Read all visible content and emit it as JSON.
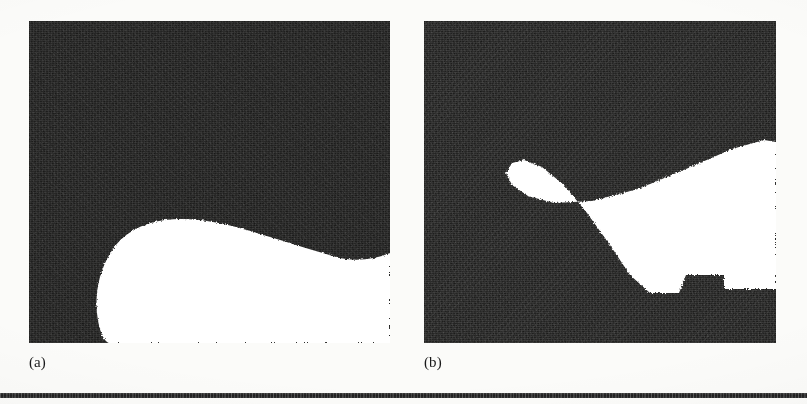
{
  "figure": {
    "kind": "scanned-figure",
    "page_background": "#fbfbf9",
    "panel_fill": "#131312",
    "region_fill": "#ffffff",
    "rule_color": "#2a2a2a",
    "panels": [
      {
        "id": "a",
        "caption": "(a)",
        "x": 29,
        "y": 21,
        "width": 361,
        "height": 322,
        "description": "binary segmentation result, dark background with a single white crescent-shaped region in the lower half that touches the bottom and right borders",
        "region_path": "M 361 206 L 361 232 C 344 239 325 241 307 236 C 272 226 243 216 214 208 C 186 200 160 196 136 199 C 112 202 93 213 82 231 C 70 250 66 272 68 292 C 70 311 76 325 84 322 L 300 322 L 300 322 L 361 322 Z"
      },
      {
        "id": "b",
        "caption": "(b)",
        "x": 424,
        "y": 21,
        "width": 352,
        "height": 322,
        "description": "binary segmentation result, dark background with a white wedge-shaped region entering from the right border, notched at lower right",
        "region_path": "M 352 121 L 352 268 L 300 268 L 300 254 L 262 254 L 255 272 L 226 272 L 206 254 L 186 224 L 163 192 L 140 164 L 118 146 L 100 139 L 88 142 L 82 152 L 88 164 L 104 175 L 130 182 L 168 180 L 214 168 L 262 148 L 308 128 L 340 119 Z"
      }
    ]
  },
  "bottom_rule": {
    "visible": true,
    "x": 0,
    "y": 393,
    "width": 807,
    "height": 5
  }
}
